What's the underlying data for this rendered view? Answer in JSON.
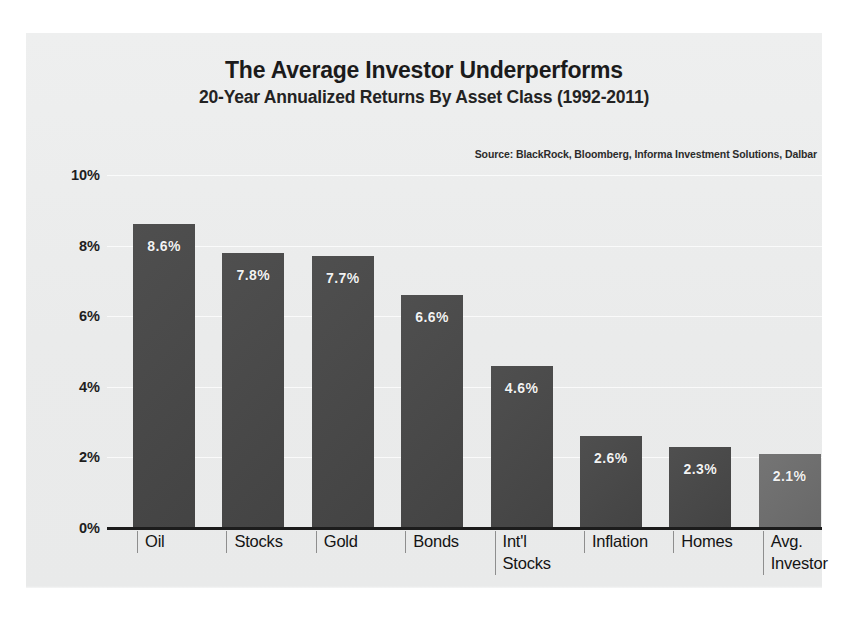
{
  "chart_data": {
    "type": "bar",
    "title": "The Average Investor Underperforms",
    "subtitle": "20-Year Annualized Returns By Asset Class (1992-2011)",
    "source": "Source: BlackRock, Bloomberg, Informa Investment Solutions, Dalbar",
    "xlabel": "",
    "ylabel": "",
    "ylim": [
      0,
      10
    ],
    "ytick_labels": [
      "0%",
      "2%",
      "4%",
      "6%",
      "8%",
      "10%"
    ],
    "ytick_values": [
      0,
      2,
      4,
      6,
      8,
      10
    ],
    "grid": true,
    "legend": "none",
    "categories": [
      "Oil",
      "Stocks",
      "Gold",
      "Bonds",
      "Int'l\nStocks",
      "Inflation",
      "Homes",
      "Avg.\nInvestor"
    ],
    "values": [
      8.6,
      7.7,
      7.7,
      6.6,
      4.6,
      2.6,
      2.3,
      2.1
    ],
    "value_labels": [
      "8.6%",
      "7.8%",
      "7.7%",
      "6.6%",
      "4.6%",
      "2.6%",
      "2.3%",
      "2.1%"
    ],
    "bar_values": [
      8.6,
      7.8,
      7.7,
      6.6,
      4.6,
      2.6,
      2.3,
      2.1
    ],
    "highlight_index": 7,
    "colors": {
      "bar": "#474747",
      "bar_highlight": "#6c6c6c",
      "axis": "#1c1c1c",
      "panel_background": "#eceded",
      "text": "#1b1b1b",
      "bar_label_text": "#f2f2f2"
    }
  }
}
